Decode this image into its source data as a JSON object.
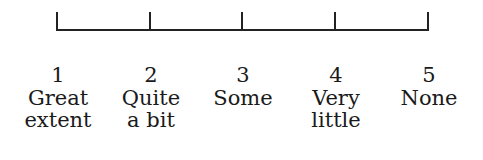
{
  "scale": {
    "ticks": [
      57,
      150,
      242,
      335,
      427
    ],
    "points": [
      {
        "number": "1",
        "line1": "Great",
        "line2": "extent"
      },
      {
        "number": "2",
        "line1": "Quite",
        "line2": "a bit"
      },
      {
        "number": "3",
        "line1": "Some",
        "line2": ""
      },
      {
        "number": "4",
        "line1": "Very",
        "line2": "little"
      },
      {
        "number": "5",
        "line1": "None",
        "line2": ""
      }
    ]
  }
}
